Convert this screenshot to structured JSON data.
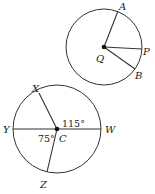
{
  "diagram": {
    "circle_q": {
      "center_label": "Q",
      "points": [
        {
          "name": "A",
          "label": "A"
        },
        {
          "name": "P",
          "label": "P"
        },
        {
          "name": "B",
          "label": "B"
        }
      ]
    },
    "circle_c": {
      "center_label": "C",
      "points": [
        {
          "name": "X",
          "label": "X"
        },
        {
          "name": "Y",
          "label": "Y"
        },
        {
          "name": "W",
          "label": "W"
        },
        {
          "name": "Z",
          "label": "Z"
        }
      ],
      "angles": [
        {
          "between": "XCW",
          "label": "115°"
        },
        {
          "between": "YCZ",
          "label": "75°"
        }
      ]
    }
  }
}
